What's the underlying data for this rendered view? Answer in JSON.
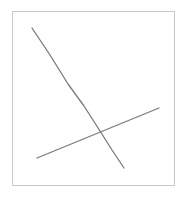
{
  "canvas": {
    "width": 188,
    "height": 200,
    "background": "#ffffff",
    "frame": {
      "x": 12,
      "y": 11,
      "width": 163,
      "height": 175,
      "border_color": "#c8c8c8"
    },
    "stroke_color": "#7a7a7a",
    "lines": [
      {
        "name": "descending-curve",
        "points": "32,28 50,55 68,84 84,106 100,131 112,150 124,168"
      },
      {
        "name": "ascending-line",
        "points": "37,158 159,108"
      }
    ]
  }
}
